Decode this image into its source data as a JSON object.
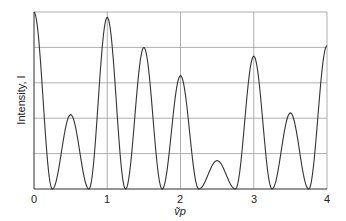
{
  "chart_data": {
    "type": "line",
    "title": "",
    "xlabel": "ṽp",
    "ylabel": "Intensity, I",
    "xlim": [
      0,
      4
    ],
    "ylim": [
      0,
      1
    ],
    "grid": true,
    "legend": null,
    "x_ticks": [
      "0",
      "1",
      "2",
      "3",
      "4"
    ],
    "y_ticks": [],
    "y_gridlines": [
      0,
      0.2,
      0.4,
      0.6,
      0.8,
      1.0
    ],
    "series": [
      {
        "name": "Intensity",
        "peaks": [
          {
            "x": 0.0,
            "y": 1.0
          },
          {
            "x": 0.5,
            "y": 0.42
          },
          {
            "x": 1.0,
            "y": 0.97
          },
          {
            "x": 1.5,
            "y": 0.8
          },
          {
            "x": 2.0,
            "y": 0.64
          },
          {
            "x": 2.5,
            "y": 0.16
          },
          {
            "x": 3.0,
            "y": 0.75
          },
          {
            "x": 3.5,
            "y": 0.43
          },
          {
            "x": 4.0,
            "y": 0.81
          }
        ],
        "minima": [
          {
            "x": 0.25,
            "y": 0
          },
          {
            "x": 0.75,
            "y": 0
          },
          {
            "x": 1.25,
            "y": 0
          },
          {
            "x": 1.75,
            "y": 0
          },
          {
            "x": 2.25,
            "y": 0
          },
          {
            "x": 2.75,
            "y": 0
          },
          {
            "x": 3.25,
            "y": 0
          },
          {
            "x": 3.75,
            "y": 0
          }
        ]
      }
    ]
  },
  "labels": {
    "x_axis": "ṽp",
    "y_axis": "Intensity, I",
    "x_tick_0": "0",
    "x_tick_1": "1",
    "x_tick_2": "2",
    "x_tick_3": "3",
    "x_tick_4": "4"
  },
  "colors": {
    "curve": "#333333",
    "grid": "#9a9a9a",
    "axis": "#555555"
  }
}
